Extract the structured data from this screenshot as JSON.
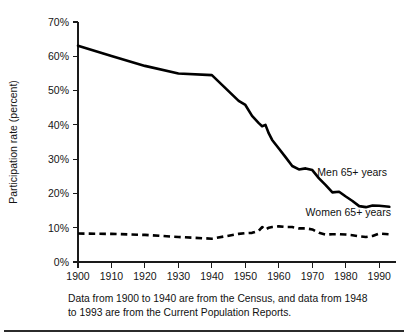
{
  "caption": {
    "text": "Data from 1900 to 1940 are from the Census, and data from 1948 to 1993 are from the Current Population Reports."
  },
  "annotations": {
    "men_label": "Men 65+ years",
    "women_label": "Women 65+ years"
  },
  "chart_data": {
    "type": "line",
    "title": "",
    "xlabel": "",
    "ylabel": "Participation rate (percent)",
    "xlim": [
      1900,
      1993
    ],
    "ylim": [
      0,
      70
    ],
    "grid": false,
    "legend": "inline-annotations",
    "xticks": [
      1900,
      1910,
      1920,
      1930,
      1940,
      1950,
      1960,
      1970,
      1980,
      1990
    ],
    "xticklabels": [
      "1900",
      "1910",
      "1920",
      "1930",
      "1940",
      "1950",
      "1960",
      "1970",
      "1980",
      "1990"
    ],
    "yticks": [
      0,
      10,
      20,
      30,
      40,
      50,
      60,
      70
    ],
    "yticklabels": [
      "0%",
      "10%",
      "20%",
      "30%",
      "40%",
      "50%",
      "60%",
      "70%"
    ],
    "series": [
      {
        "name": "Men 65+ years",
        "style": "solid",
        "x": [
          1900,
          1910,
          1920,
          1930,
          1940,
          1948,
          1950,
          1952,
          1954,
          1955,
          1956,
          1957,
          1958,
          1960,
          1962,
          1964,
          1966,
          1968,
          1970,
          1972,
          1974,
          1976,
          1978,
          1980,
          1982,
          1984,
          1986,
          1988,
          1990,
          1993
        ],
        "values": [
          63.1,
          60.1,
          57.2,
          55.0,
          54.5,
          47.0,
          45.8,
          42.6,
          40.5,
          39.6,
          40.0,
          37.5,
          35.6,
          33.1,
          30.6,
          28.0,
          27.0,
          27.3,
          26.8,
          24.4,
          22.4,
          20.3,
          20.5,
          19.1,
          17.8,
          16.3,
          16.0,
          16.5,
          16.4,
          16.1
        ]
      },
      {
        "name": "Women 65+ years",
        "style": "dashed",
        "x": [
          1900,
          1910,
          1920,
          1930,
          1940,
          1948,
          1950,
          1952,
          1954,
          1955,
          1956,
          1957,
          1958,
          1960,
          1962,
          1964,
          1966,
          1968,
          1970,
          1972,
          1974,
          1976,
          1978,
          1980,
          1982,
          1984,
          1986,
          1988,
          1990,
          1993
        ],
        "values": [
          8.3,
          8.2,
          7.9,
          7.3,
          6.8,
          8.2,
          8.4,
          8.5,
          9.1,
          10.2,
          9.4,
          10.0,
          10.2,
          10.4,
          10.2,
          10.2,
          9.8,
          9.8,
          9.5,
          8.5,
          8.0,
          8.1,
          8.1,
          8.0,
          7.8,
          7.5,
          7.3,
          7.6,
          8.3,
          8.1
        ]
      }
    ]
  },
  "geometry": {
    "plot_left": 78,
    "plot_right": 396,
    "plot_top": 22,
    "plot_bottom": 262,
    "x_min": 1900,
    "x_max": 1995,
    "y_min": 0,
    "y_max": 70,
    "men_annotation_x": 1971.5,
    "men_annotation_y": 25.0,
    "women_annotation_x": 1968.0,
    "women_annotation_y": 13.4
  }
}
